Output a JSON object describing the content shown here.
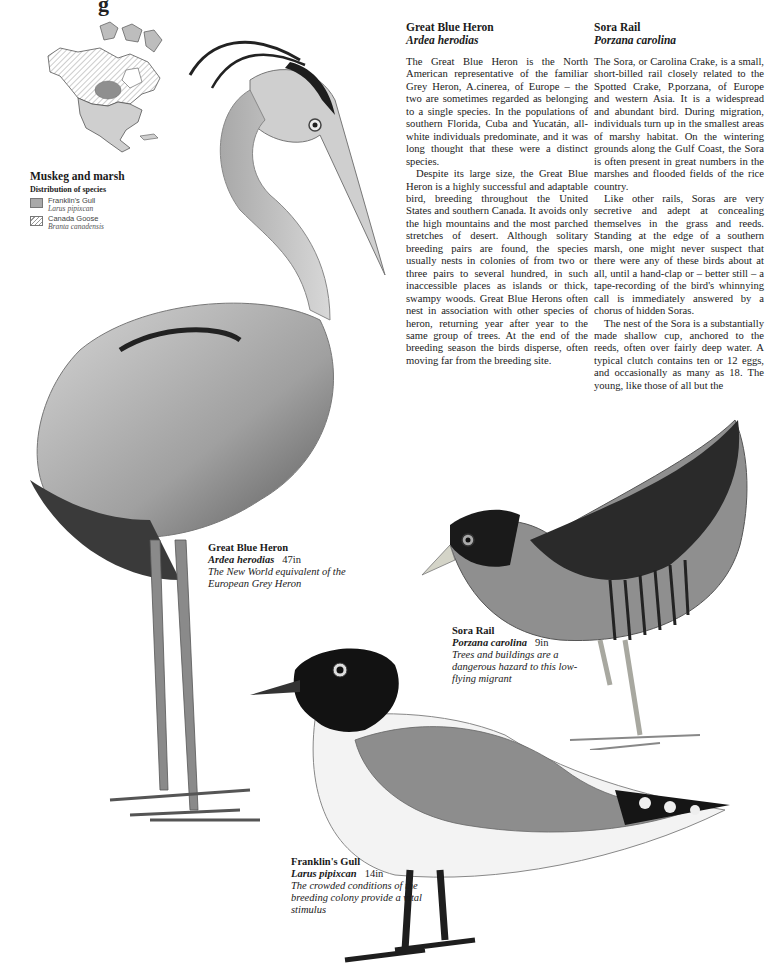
{
  "page": {
    "top_cut_glyph": "g"
  },
  "map": {
    "title": "Muskeg and marsh",
    "subtitle": "Distribution of species",
    "legend": [
      {
        "name": "Franklin's Gull",
        "latin": "Larus pipixcan",
        "pattern": "solid-grey"
      },
      {
        "name": "Canada Goose",
        "latin": "Branta canadensis",
        "pattern": "hatched"
      }
    ],
    "colors": {
      "solid": "#a9a9a9",
      "hatch": "#999999",
      "land": "#ffffff",
      "outline": "#555555"
    }
  },
  "articles": [
    {
      "title": "Great Blue Heron",
      "latin": "Ardea herodias",
      "paragraphs": [
        "The Great Blue Heron is the North American representative of the familiar Grey Heron, A.cinerea, of Europe – the two are sometimes regarded as belonging to a single species. In the populations of south­ern Florida, Cuba and Yucatán, all-white individuals predominate, and it was long thought that these were a distinct species.",
        "Despite its large size, the Great Blue Heron is a highly successful and adaptable bird, breeding throughout the United States and southern Canada. It avoids only the high mountains and the most parched stretches of desert. Although solitary breeding pairs are found, the species usually nests in colonies of from two or three pairs to several hundred, in such inaccessible places as islands or thick, swampy woods. Great Blue Herons often nest in association with other species of heron, returning year after year to the same group of trees. At the end of the breeding season the birds disperse, often moving far from the breeding site."
      ]
    },
    {
      "title": "Sora Rail",
      "latin": "Porzana carolina",
      "paragraphs": [
        "The Sora, or Carolina Crake, is a small, short-billed rail closely related to the Spotted Crake, P.porzana, of Europe and western Asia. It is a widespread and abundant bird. During migration, individuals turn up in the smallest areas of marshy habitat. On the wintering grounds along the Gulf Coast, the Sora is often present in great numbers in the marshes and flooded fields of the rice country.",
        "Like other rails, Soras are very secretive and adept at concealing themselves in the grass and reeds. Standing at the edge of a southern marsh, one might never suspect that there were any of these birds about at all, until a hand-clap or – better still – a tape-recording of the bird's whinnying call is immediately an­swered by a chorus of hidden Soras.",
        "The nest of the Sora is a substan­tially made shallow cup, anchored to the reeds, often over fairly deep water. A typical clutch contains ten or 12 eggs, and occasionally as many as 18. The young, like those of all but the"
      ]
    }
  ],
  "captions": {
    "heron": {
      "name": "Great Blue Heron",
      "latin": "Ardea herodias",
      "size": "47in",
      "desc": "The New World equivalent of the European Grey Heron"
    },
    "sora": {
      "name": "Sora Rail",
      "latin": "Porzana carolina",
      "size": "9in",
      "desc": "Trees and buildings are a dangerous hazard to this low-flying migrant"
    },
    "gull": {
      "name": "Franklin's Gull",
      "latin": "Larus pipixcan",
      "size": "14in",
      "desc": "The crowded conditions of the breeding colony provide a vital stimulus"
    }
  },
  "illustrations": [
    {
      "subject": "great-blue-heron",
      "palette": [
        "#2a2a2a",
        "#8c8c8c",
        "#b5b5b5",
        "#e0e0e0"
      ]
    },
    {
      "subject": "sora-rail",
      "palette": [
        "#1f1f1f",
        "#6e6e6e",
        "#9a9a9a",
        "#d8d8d8"
      ]
    },
    {
      "subject": "franklins-gull",
      "palette": [
        "#111111",
        "#8a8a8a",
        "#f2f2f2",
        "#c8c8c8"
      ]
    }
  ]
}
